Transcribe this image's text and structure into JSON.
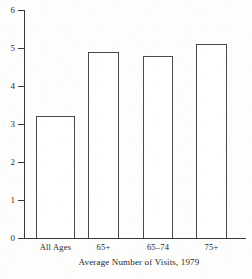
{
  "chart_data": {
    "type": "bar",
    "title": "",
    "caption": "Average Number of Visits, 1979",
    "xlabel": "",
    "ylabel": "",
    "categories": [
      "All Ages",
      "65+",
      "65–74",
      "75+"
    ],
    "values": [
      3.2,
      4.9,
      4.8,
      5.1
    ],
    "series": [
      {
        "name": "Average Number of Visits",
        "values": [
          3.2,
          4.9,
          4.8,
          5.1
        ]
      }
    ],
    "ylim": [
      0,
      6
    ],
    "y_ticks": [
      0,
      1,
      2,
      3,
      4,
      5,
      6
    ],
    "y_tick_labels": [
      "0",
      "1",
      "2",
      "3",
      "4",
      "5",
      "6"
    ],
    "grid": false,
    "legend": false,
    "legend_position": "none",
    "bar_style": {
      "fill": "#ffffff",
      "edge": "#4a4a4a"
    }
  },
  "axes": {
    "y_tick_labels": [
      "6",
      "5",
      "4",
      "3",
      "2",
      "1",
      "0"
    ]
  },
  "bars": [
    {
      "label": "All Ages",
      "value": 3.2
    },
    {
      "label": "65+",
      "value": 4.9
    },
    {
      "label": "65–74",
      "value": 4.8
    },
    {
      "label": "75+",
      "value": 5.1
    }
  ],
  "caption": {
    "text": "Average Number of Visits, 1979"
  },
  "colors": {
    "background": "#fdfdfb",
    "axis": "#3a3a3a",
    "bar_edge": "#4a4a4a",
    "bar_fill": "#ffffff",
    "text": "#262626"
  }
}
